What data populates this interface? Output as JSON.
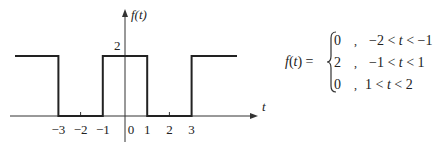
{
  "plot": {
    "y_axis_label": "f(t)",
    "x_axis_label": "t",
    "y_tick_label": "2",
    "x_tick_labels": [
      "-3",
      "-2",
      "-1",
      "0",
      "1",
      "2",
      "3"
    ]
  },
  "chart_data": {
    "type": "line",
    "title": "",
    "xlabel": "t",
    "ylabel": "f(t)",
    "segments": [
      {
        "x": [
          -5,
          -3
        ],
        "y": 2
      },
      {
        "x": [
          -3,
          -1
        ],
        "y": 0
      },
      {
        "x": [
          -1,
          1
        ],
        "y": 2
      },
      {
        "x": [
          1,
          3
        ],
        "y": 0
      },
      {
        "x": [
          3,
          5
        ],
        "y": 2
      }
    ],
    "x_ticks": [
      -3,
      -2,
      -1,
      0,
      1,
      2,
      3
    ],
    "y_ticks": [
      2
    ],
    "xlim": [
      -5,
      6
    ],
    "ylim": [
      0,
      3
    ]
  },
  "equation": {
    "lhs": "f(t) =",
    "cases": [
      {
        "value": "0",
        "sep": ",",
        "condition": "−2 < t < −1"
      },
      {
        "value": "2",
        "sep": ",",
        "condition": "−1 < t < 1"
      },
      {
        "value": "0",
        "sep": ",",
        "condition": "1 < t < 2"
      }
    ]
  }
}
